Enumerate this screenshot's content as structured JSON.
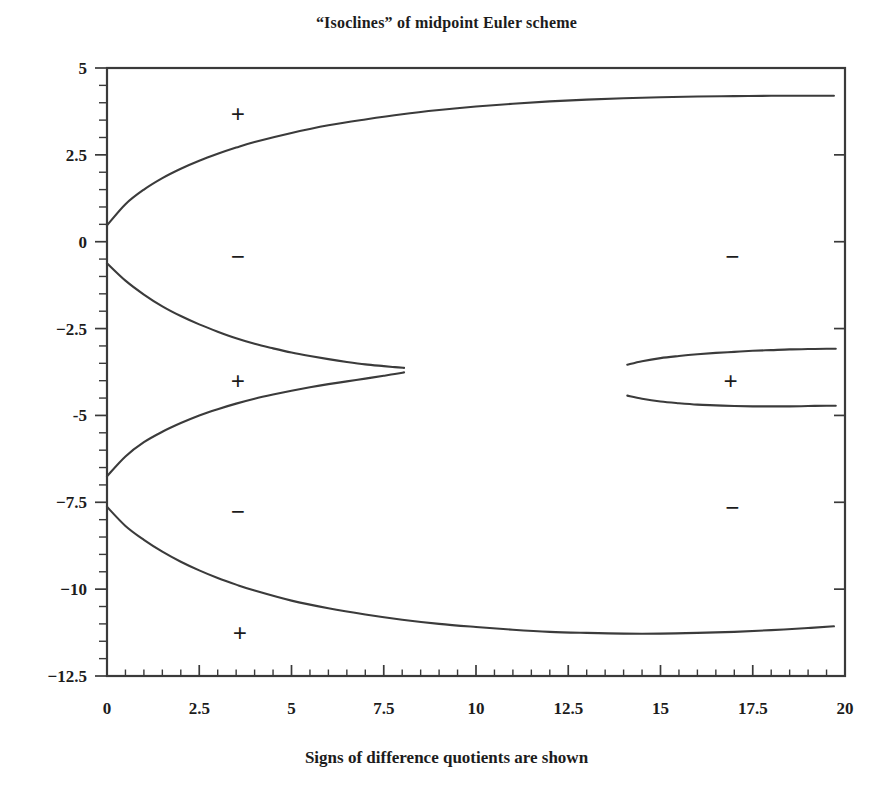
{
  "chart_data": {
    "type": "line",
    "title": "“Isoclines” of midpoint Euler scheme",
    "xlabel": "Signs of difference quotients are shown",
    "ylabel": "",
    "xlim": [
      0,
      20
    ],
    "ylim": [
      -12.5,
      5
    ],
    "grid": false,
    "legend": "none",
    "xticks": [
      "0",
      "2.5",
      "5",
      "7.5",
      "10",
      "12.5",
      "15",
      "17.5",
      "20"
    ],
    "xtick_values": [
      0,
      2.5,
      5,
      7.5,
      10,
      12.5,
      15,
      17.5,
      20
    ],
    "yticks": [
      "5",
      "2.5",
      "0",
      "−2.5",
      "-5",
      "−7.5",
      "−10",
      "−12.5"
    ],
    "ytick_values": [
      5,
      2.5,
      0,
      -2.5,
      -5,
      -7.5,
      -10,
      -12.5
    ],
    "minor_tick_subdivisions": 5,
    "series": [
      {
        "name": "upper-branch",
        "points": [
          [
            0.0,
            0.47
          ],
          [
            0.5,
            1.08
          ],
          [
            1.0,
            1.5
          ],
          [
            1.5,
            1.83
          ],
          [
            2.0,
            2.1
          ],
          [
            2.5,
            2.33
          ],
          [
            3.0,
            2.53
          ],
          [
            3.5,
            2.71
          ],
          [
            4.0,
            2.87
          ],
          [
            5.0,
            3.13
          ],
          [
            6.0,
            3.35
          ],
          [
            7.0,
            3.52
          ],
          [
            8.0,
            3.67
          ],
          [
            9.0,
            3.79
          ],
          [
            10.0,
            3.89
          ],
          [
            11.0,
            3.97
          ],
          [
            12.0,
            4.04
          ],
          [
            13.0,
            4.09
          ],
          [
            14.0,
            4.13
          ],
          [
            15.0,
            4.16
          ],
          [
            16.0,
            4.18
          ],
          [
            17.0,
            4.19
          ],
          [
            18.0,
            4.2
          ],
          [
            19.0,
            4.2
          ],
          [
            19.7,
            4.2
          ]
        ]
      },
      {
        "name": "second-branch",
        "points": [
          [
            0.0,
            -0.62
          ],
          [
            0.5,
            -1.12
          ],
          [
            1.0,
            -1.52
          ],
          [
            1.5,
            -1.86
          ],
          [
            2.0,
            -2.14
          ],
          [
            2.5,
            -2.38
          ],
          [
            3.0,
            -2.59
          ],
          [
            3.5,
            -2.78
          ],
          [
            4.0,
            -2.94
          ],
          [
            4.5,
            -3.07
          ],
          [
            5.0,
            -3.19
          ],
          [
            5.5,
            -3.29
          ],
          [
            6.0,
            -3.38
          ],
          [
            6.5,
            -3.46
          ],
          [
            7.0,
            -3.53
          ],
          [
            7.5,
            -3.58
          ],
          [
            7.8,
            -3.61
          ],
          [
            8.05,
            -3.63
          ]
        ]
      },
      {
        "name": "third-branch",
        "points": [
          [
            0.0,
            -6.75
          ],
          [
            0.5,
            -6.18
          ],
          [
            1.0,
            -5.77
          ],
          [
            1.5,
            -5.47
          ],
          [
            2.0,
            -5.22
          ],
          [
            2.5,
            -5.0
          ],
          [
            3.0,
            -4.82
          ],
          [
            3.5,
            -4.66
          ],
          [
            4.0,
            -4.52
          ],
          [
            4.5,
            -4.4
          ],
          [
            5.0,
            -4.29
          ],
          [
            5.5,
            -4.19
          ],
          [
            6.0,
            -4.1
          ],
          [
            6.5,
            -4.02
          ],
          [
            7.0,
            -3.94
          ],
          [
            7.5,
            -3.86
          ],
          [
            7.8,
            -3.81
          ],
          [
            8.05,
            -3.76
          ]
        ]
      },
      {
        "name": "lower-branch",
        "points": [
          [
            0.0,
            -7.63
          ],
          [
            0.5,
            -8.18
          ],
          [
            1.0,
            -8.58
          ],
          [
            1.5,
            -8.92
          ],
          [
            2.0,
            -9.21
          ],
          [
            2.5,
            -9.46
          ],
          [
            3.0,
            -9.68
          ],
          [
            3.5,
            -9.87
          ],
          [
            4.0,
            -10.04
          ],
          [
            5.0,
            -10.33
          ],
          [
            6.0,
            -10.55
          ],
          [
            7.0,
            -10.73
          ],
          [
            8.0,
            -10.88
          ],
          [
            9.0,
            -11.0
          ],
          [
            10.0,
            -11.09
          ],
          [
            11.0,
            -11.17
          ],
          [
            12.0,
            -11.23
          ],
          [
            13.0,
            -11.26
          ],
          [
            14.0,
            -11.28
          ],
          [
            15.0,
            -11.28
          ],
          [
            16.0,
            -11.26
          ],
          [
            17.0,
            -11.23
          ],
          [
            18.0,
            -11.18
          ],
          [
            19.0,
            -11.12
          ],
          [
            19.7,
            -11.07
          ]
        ]
      },
      {
        "name": "right-upper-branch",
        "points": [
          [
            14.1,
            -3.54
          ],
          [
            14.5,
            -3.44
          ],
          [
            15.0,
            -3.35
          ],
          [
            15.5,
            -3.29
          ],
          [
            16.0,
            -3.24
          ],
          [
            16.5,
            -3.2
          ],
          [
            17.0,
            -3.17
          ],
          [
            17.5,
            -3.14
          ],
          [
            18.0,
            -3.12
          ],
          [
            18.5,
            -3.1
          ],
          [
            19.0,
            -3.09
          ],
          [
            19.5,
            -3.08
          ],
          [
            19.75,
            -3.08
          ]
        ]
      },
      {
        "name": "right-lower-branch",
        "points": [
          [
            14.1,
            -4.43
          ],
          [
            14.5,
            -4.52
          ],
          [
            15.0,
            -4.6
          ],
          [
            15.5,
            -4.65
          ],
          [
            16.0,
            -4.69
          ],
          [
            16.5,
            -4.71
          ],
          [
            17.0,
            -4.73
          ],
          [
            17.5,
            -4.74
          ],
          [
            18.0,
            -4.74
          ],
          [
            18.5,
            -4.74
          ],
          [
            19.0,
            -4.73
          ],
          [
            19.5,
            -4.72
          ],
          [
            19.75,
            -4.72
          ]
        ]
      }
    ],
    "annotations": [
      {
        "label": "+",
        "x": 3.55,
        "y": 3.67
      },
      {
        "label": "−",
        "x": 3.55,
        "y": -0.42
      },
      {
        "label": "+",
        "x": 3.55,
        "y": -4.0
      },
      {
        "label": "−",
        "x": 3.55,
        "y": -7.75
      },
      {
        "label": "+",
        "x": 3.6,
        "y": -11.25
      },
      {
        "label": "−",
        "x": 16.95,
        "y": -0.42
      },
      {
        "label": "+",
        "x": 16.9,
        "y": -4.0
      },
      {
        "label": "−",
        "x": 16.95,
        "y": -7.65
      }
    ]
  },
  "colors": {
    "curve": "#3b3b3b",
    "axis": "#3a3a3a",
    "text": "#1c1c1c",
    "background": "#ffffff"
  }
}
